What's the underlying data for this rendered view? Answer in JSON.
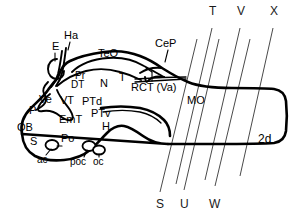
{
  "figure": {
    "caption_label": "2d"
  },
  "region_labels": [
    {
      "id": "E",
      "text": "E",
      "x": 52,
      "y": 47
    },
    {
      "id": "Ha",
      "text": "Ha",
      "x": 67,
      "y": 36
    },
    {
      "id": "TeO",
      "text": "TeO",
      "x": 104,
      "y": 54
    },
    {
      "id": "CeP",
      "text": "CeP",
      "x": 160,
      "y": 44
    },
    {
      "id": "Pr",
      "text": "Pr",
      "x": 79,
      "y": 76
    },
    {
      "id": "DT",
      "text": "DT",
      "x": 75,
      "y": 85
    },
    {
      "id": "N",
      "text": "N",
      "x": 103,
      "y": 84
    },
    {
      "id": "T",
      "text": "T",
      "x": 121,
      "y": 78
    },
    {
      "id": "RCT",
      "text": "RCT (Va)",
      "x": 145,
      "y": 87
    },
    {
      "id": "Ve",
      "text": "Ve",
      "x": 43,
      "y": 100
    },
    {
      "id": "VT",
      "text": "VT",
      "x": 64,
      "y": 101
    },
    {
      "id": "PTd",
      "text": "PTd",
      "x": 85,
      "y": 102
    },
    {
      "id": "P",
      "text": "P",
      "x": 31,
      "y": 110
    },
    {
      "id": "EmT",
      "text": "EmT",
      "x": 62,
      "y": 119
    },
    {
      "id": "PTv",
      "text": "PTv",
      "x": 94,
      "y": 114
    },
    {
      "id": "H",
      "text": "H",
      "x": 104,
      "y": 127
    },
    {
      "id": "OB",
      "text": "OB",
      "x": 19,
      "y": 128
    },
    {
      "id": "S",
      "text": "S",
      "x": 32,
      "y": 142
    },
    {
      "id": "Po",
      "text": "Po",
      "x": 63,
      "y": 139
    },
    {
      "id": "ac",
      "text": "ac",
      "x": 38,
      "y": 159
    },
    {
      "id": "poc",
      "text": "poc",
      "x": 73,
      "y": 161
    },
    {
      "id": "oc",
      "text": "oc",
      "x": 94,
      "y": 161
    },
    {
      "id": "MO",
      "text": "MO",
      "x": 191,
      "y": 101
    },
    {
      "id": "2d",
      "text": "2d",
      "x": 261,
      "y": 139
    }
  ],
  "section_planes": {
    "top_labels": [
      {
        "id": "T",
        "text": "T",
        "x": 211,
        "y": 11
      },
      {
        "id": "V",
        "text": "V",
        "x": 239,
        "y": 11
      },
      {
        "id": "X",
        "text": "X",
        "x": 272,
        "y": 11
      }
    ],
    "bottom_labels": [
      {
        "id": "S",
        "text": "S",
        "x": 158,
        "y": 198
      },
      {
        "id": "U",
        "text": "U",
        "x": 182,
        "y": 198
      },
      {
        "id": "W",
        "text": "W",
        "x": 211,
        "y": 198
      }
    ],
    "line_count": 6
  },
  "colors": {
    "ink": "#000000",
    "plane_line": "#4a4a4a",
    "background": "#ffffff"
  }
}
